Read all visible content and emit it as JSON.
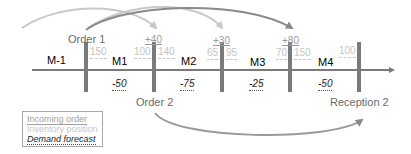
{
  "colors": {
    "axis": "#7a7a7a",
    "bar": "#7a7a7a",
    "arc_light": "#c8c8c8",
    "arc_dark": "#8a8a8a",
    "order_text": "#9a9a9a",
    "inventory_text": "#c4c4c4",
    "demand_text": "#222222"
  },
  "periods": [
    "M-1",
    "M1",
    "M2",
    "M3",
    "M4"
  ],
  "events": {
    "order1": "Order 1",
    "order2": "Order 2",
    "reception2": "Reception 2"
  },
  "incoming_orders": [
    "+40",
    "+30",
    "+80"
  ],
  "inventory": {
    "bar1_right": "150",
    "bar2_left": "100",
    "bar2_right": "140",
    "bar3_left": "65",
    "bar3_right": "95",
    "bar4_left": "70",
    "bar4_right": "150",
    "bar5_left": "100"
  },
  "demand_forecast": [
    "-50",
    "-75",
    "-25",
    "-50"
  ],
  "legend": {
    "incoming_order": "Incoming order",
    "inventory_position": "Inventory position",
    "demand_forecast": "Demand forecast"
  }
}
